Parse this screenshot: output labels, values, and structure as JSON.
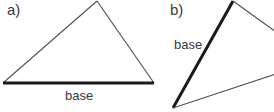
{
  "panels": [
    {
      "label": "a)",
      "base_label": "base",
      "description": "Triangle with its horizontal bottom side highlighted as the base"
    },
    {
      "label": "b)",
      "base_label": "base",
      "description": "Rotated triangle with its slanted left side highlighted as the base"
    }
  ],
  "colors": {
    "thin_edge": "#555555",
    "base_edge": "#1a1a1a",
    "text": "#3a3a3a"
  }
}
